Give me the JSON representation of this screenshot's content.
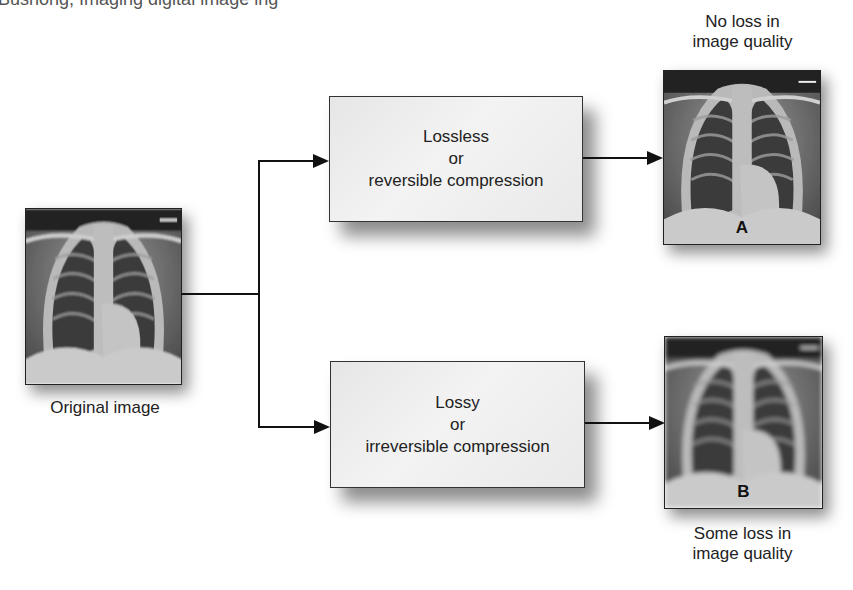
{
  "header": {
    "cut_text": "Bushong, Imaging digital image ing"
  },
  "original": {
    "caption": "Original image",
    "icon": "chest-xray-image"
  },
  "lossless": {
    "line1": "Lossless",
    "line2": "or",
    "line3": "reversible compression"
  },
  "lossy": {
    "line1": "Lossy",
    "line2": "or",
    "line3": "irreversible compression"
  },
  "result_a": {
    "label": "A",
    "caption_line1": "No loss in",
    "caption_line2": "image quality",
    "icon": "chest-xray-image"
  },
  "result_b": {
    "label": "B",
    "caption_line1": "Some loss in",
    "caption_line2": "image quality",
    "icon": "chest-xray-image-blurred"
  },
  "colors": {
    "line": "#111111",
    "box_fill": "#ececec",
    "box_border": "#333333"
  }
}
